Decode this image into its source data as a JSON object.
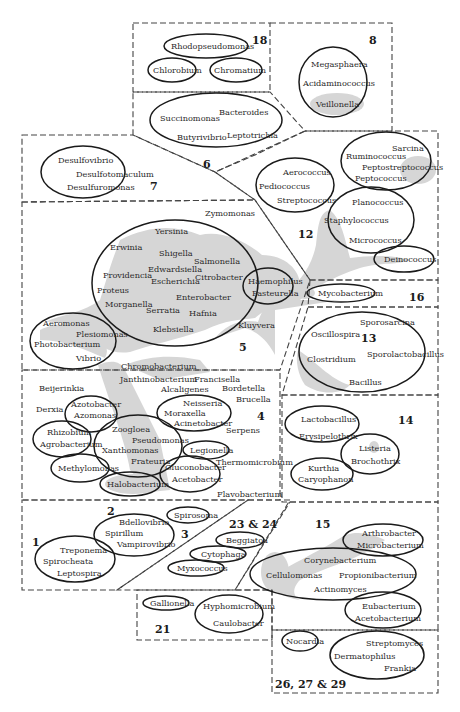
{
  "figure": {
    "type": "bacterial taxonomic relationship diagram",
    "groups": [
      {
        "number": "18",
        "genera": [
          "Rhodopseudomonas",
          "Chlorobium",
          "Chromatium"
        ]
      },
      {
        "number": "8",
        "genera": [
          "Megasphaera",
          "Acidaminococcus",
          "Veillonella"
        ]
      },
      {
        "number": "6",
        "genera": [
          "Succinomonas",
          "Bacteroides",
          "Butyrivibrio",
          "Leptotrichia"
        ]
      },
      {
        "number": "7",
        "genera": [
          "Desulfovibrio",
          "Desulfotomaculum",
          "Desulfuromonas"
        ]
      },
      {
        "number": "12",
        "genera": [
          "Aerococcus",
          "Pediococcus",
          "Streptococcus",
          "Sarcina",
          "Ruminococcus",
          "Peptostreptococcus",
          "Peptococcus",
          "Planococcus",
          "Staphylococcus",
          "Micrococcus",
          "Deinococcus"
        ]
      },
      {
        "number": "5",
        "genera": [
          "Zymomonas",
          "Yersinia",
          "Erwinia",
          "Shigella",
          "Salmonella",
          "Edwardsiella",
          "Providencia",
          "Escherichia",
          "Citrobacter",
          "Proteus",
          "Enterobacter",
          "Morganella",
          "Serratia",
          "Hafnia",
          "Klebsiella",
          "Haemophilus",
          "Pasteurella",
          "Kluyvera",
          "Aeromonas",
          "Plesiomonas",
          "Photobacterium",
          "Vibrio",
          "Chromobacterium"
        ]
      },
      {
        "number": "16",
        "genera": [
          "Mycobacterium"
        ]
      },
      {
        "number": "13",
        "genera": [
          "Sporosarcina",
          "Oscillospira",
          "Sporolactobacillus",
          "Clostridium",
          "Bacillus"
        ]
      },
      {
        "number": "4",
        "genera": [
          "Janthinobacterium",
          "Francisella",
          "Beijerinkia",
          "Alcaligenes",
          "Bordetella",
          "Brucella",
          "Derxia",
          "Azotobacter",
          "Azomonas",
          "Neisseria",
          "Moraxella",
          "Acinetobacter",
          "Zoogloea",
          "Pseudomonas",
          "Rhizobium",
          "Agrobacterium",
          "Xanthomonas",
          "Serpens",
          "Legionella",
          "Frateuria",
          "Thermomicrobium",
          "Methylomonas",
          "Gluconobacter",
          "Acetobacter",
          "Halobacterium",
          "Flavobacterium"
        ]
      },
      {
        "number": "14",
        "genera": [
          "Lactobacillus",
          "Erysipelothrix",
          "Listeria",
          "Brochothrix",
          "Kurthia",
          "Caryophanon"
        ]
      },
      {
        "number": "1",
        "genera": [
          "Treponema",
          "Spirochaeta",
          "Leptospira"
        ]
      },
      {
        "number": "2",
        "genera": [
          "Bdellovibrio",
          "Spirillum",
          "Vampirovibrio"
        ]
      },
      {
        "number": "3",
        "genera": [
          "Spirosoma"
        ]
      },
      {
        "number": "23 & 24",
        "genera": [
          "Beggiatoa",
          "Cytophaga",
          "Myxococcus"
        ]
      },
      {
        "number": "15",
        "genera": [
          "Arthrobacter",
          "Microbacterium",
          "Corynebacterium",
          "Cellulomonas",
          "Propionibacterium",
          "Actinomyces",
          "Eubacterium",
          "Acetobacterium"
        ]
      },
      {
        "number": "21",
        "genera": [
          "Gallionella",
          "Hyphomicrobium",
          "Caulobacter"
        ]
      },
      {
        "number": "26, 27 & 29",
        "genera": [
          "Nocardia",
          "Streptomyces",
          "Dermatophilus",
          "Frankia"
        ]
      }
    ]
  },
  "labels": {
    "n18": "18",
    "n8": "8",
    "n6": "6",
    "n7": "7",
    "n12": "12",
    "n5": "5",
    "n16": "16",
    "n13": "13",
    "n4": "4",
    "n14": "14",
    "n1": "1",
    "n2": "2",
    "n3": "3",
    "n2324": "23 & 24",
    "n15": "15",
    "n21": "21",
    "n262729": "26, 27 & 29",
    "rhodopseudomonas": "Rhodopseudomonas",
    "chlorobium": "Chlorobium",
    "chromatium": "Chromatium",
    "megasphaera": "Megasphaera",
    "acidaminococcus": "Acidaminococcus",
    "veillonella": "Veillonella",
    "succinomonas": "Succinomonas",
    "bacteroides": "Bacteroides",
    "butyrivibrio": "Butyrivibrio",
    "leptotrichia": "Leptotrichia",
    "desulfovibrio": "Desulfovibrio",
    "desulfotomaculum": "Desulfotomaculum",
    "desulfuromonas": "Desulfuromonas",
    "aerococcus": "Aerococcus",
    "pediococcus": "Pediococcus",
    "streptococcus": "Streptococcus",
    "sarcina": "Sarcina",
    "ruminococcus": "Ruminococcus",
    "peptostreptococcus": "Peptostreptococcus",
    "peptococcus": "Peptococcus",
    "planococcus": "Planococcus",
    "staphylococcus": "Staphylococcus",
    "micrococcus": "Micrococcus",
    "deinococcus": "Deinococcus",
    "zymomonas": "Zymomonas",
    "yersinia": "Yersinia",
    "erwinia": "Erwinia",
    "shigella": "Shigella",
    "salmonella": "Salmonella",
    "edwardsiella": "Edwardsiella",
    "providencia": "Providencia",
    "escherichia": "Escherichia",
    "citrobacter": "Citrobacter",
    "proteus": "Proteus",
    "enterobacter": "Enterobacter",
    "morganella": "Morganella",
    "serratia": "Serratia",
    "hafnia": "Hafnia",
    "klebsiella": "Klebsiella",
    "haemophilus": "Haemophilus",
    "pasteurella": "Pasteurella",
    "kluyvera": "Kluyvera",
    "aeromonas": "Aeromonas",
    "plesiomonas": "Plesiomonas",
    "photobacterium": "Photobacterium",
    "vibrio": "Vibrio",
    "chromobacterium": "Chromobacterium",
    "mycobacterium": "Mycobacterium",
    "sporosarcina": "Sporosarcina",
    "oscillospira": "Oscillospira",
    "sporolactobacillus": "Sporolactobacillus",
    "clostridium": "Clostridium",
    "bacillus": "Bacillus",
    "janthinobacterium": "Janthinobacterium",
    "francisella": "Francisella",
    "beijerinkia": "Beijerinkia",
    "alcaligenes": "Alcaligenes",
    "bordetella": "Bordetella",
    "brucella": "Brucella",
    "derxia": "Derxia",
    "azotobacter": "Azotobacter",
    "azomonas": "Azomonas",
    "neisseria": "Neisseria",
    "moraxella": "Moraxella",
    "acinetobacter": "Acinetobacter",
    "zoogloea": "Zoogloea",
    "pseudomonas": "Pseudomonas",
    "rhizobium": "Rhizobium",
    "agrobacterium": "Agrobacterium",
    "xanthomonas": "Xanthomonas",
    "serpens": "Serpens",
    "legionella": "Legionella",
    "frateuria": "Frateuria",
    "thermomicrobium": "Thermomicrobium",
    "methylomonas": "Methylomonas",
    "gluconobacter": "Gluconobacter",
    "acetobacter": "Acetobacter",
    "halobacterium": "Halobacterium",
    "flavobacterium": "Flavobacterium",
    "lactobacillus": "Lactobacillus",
    "erysipelothrix": "Erysipelothrix",
    "listeria": "Listeria",
    "brochothrix": "Brochothrix",
    "kurthia": "Kurthia",
    "caryophanon": "Caryophanon",
    "treponema": "Treponema",
    "spirochaeta": "Spirocheata",
    "leptospira": "Leptospira",
    "bdellovibrio": "Bdellovibrio",
    "spirillum": "Spirillum",
    "vampirovibrio": "Vampirovibrio",
    "spirosoma": "Spirosoma",
    "beggiatoa": "Beggiatoa",
    "cytophaga": "Cytophaga",
    "myxococcus": "Myxococcus",
    "arthrobacter": "Arthrobacter",
    "microbacterium": "Microbacterium",
    "corynebacterium": "Corynebacterium",
    "cellulomonas": "Cellulomonas",
    "propionibacterium": "Propionibacterium",
    "actinomyces": "Actinomyces",
    "eubacterium": "Eubacterium",
    "acetobacterium": "Acetobacterium",
    "gallionella": "Gallionella",
    "hyphomicrobium": "Hyphomicrobium",
    "caulobacter": "Caulobacter",
    "nocardia": "Nocardia",
    "streptomyces": "Streptomyces",
    "dermatophilus": "Dermatophilus",
    "frankia": "Frankia"
  },
  "colors": {
    "shade": "#d6d6d6",
    "stroke": "#1a1a1a",
    "dash": "#444444",
    "text": "#2a2a2a"
  }
}
